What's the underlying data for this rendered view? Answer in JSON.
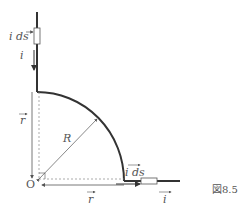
{
  "figure": {
    "caption": "図8.5",
    "labels": {
      "ids_top": "i ds",
      "i_top": "i",
      "r_vertical": "r",
      "R": "R",
      "O": "O",
      "ids_bottom": "i ds",
      "r_horizontal": "r",
      "i_bottom": "i"
    },
    "colors": {
      "wire": "#333333",
      "guide": "#777777",
      "text": "#555555"
    }
  }
}
